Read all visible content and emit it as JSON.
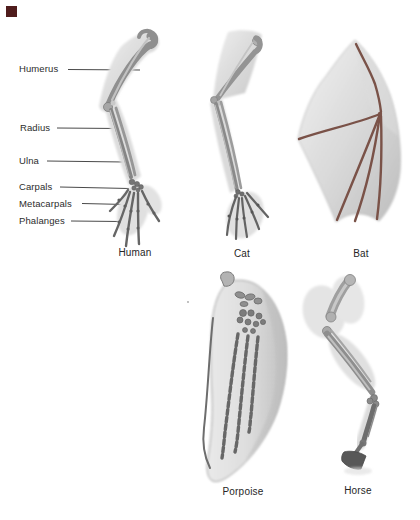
{
  "figure": {
    "type": "homologous-forelimb-comparison",
    "bone_labels": [
      "Humerus",
      "Radius",
      "Ulna",
      "Carpals",
      "Metacarpals",
      "Phalanges"
    ],
    "specimens": [
      "Human",
      "Cat",
      "Bat",
      "Porpoise",
      "Horse"
    ]
  },
  "colors": {
    "corner_marker": "#4f1c1c",
    "label_text": "#2c2c2c",
    "caption_text": "#262626",
    "leader_line": "#4a4a4a",
    "flesh_light": "#e9e9e9",
    "flesh_dark": "#c6c6c6",
    "bone_mid": "#8f8f8f",
    "bone_dark": "#5f5f5f",
    "bat_bone": "#7a5248"
  }
}
